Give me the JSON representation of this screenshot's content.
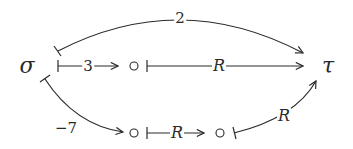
{
  "diagram": {
    "colors": {
      "stroke": "#2a2a2a",
      "background": "#ffffff"
    },
    "nodes": {
      "sigma": {
        "label": "σ"
      },
      "tau": {
        "label": "τ"
      },
      "mid_top": {
        "label": "∘"
      },
      "mid_bottom_1": {
        "label": "∘"
      },
      "mid_bottom_2": {
        "label": "∘"
      }
    },
    "edges": {
      "sigma_to_tau_top": {
        "label": "2",
        "from": "σ",
        "to": "τ",
        "style": "curved-above"
      },
      "sigma_to_mid_top": {
        "label": "3",
        "from": "σ",
        "to": "∘"
      },
      "mid_top_to_tau": {
        "label": "R",
        "from": "∘",
        "to": "τ"
      },
      "sigma_to_mid_bottom": {
        "label": "−7",
        "from": "σ",
        "to": "∘",
        "style": "curved-below"
      },
      "mid_bottom_1_to_2": {
        "label": "R",
        "from": "∘",
        "to": "∘"
      },
      "mid_bottom_2_to_tau": {
        "label": "R",
        "from": "∘",
        "to": "τ",
        "style": "curved"
      }
    }
  }
}
